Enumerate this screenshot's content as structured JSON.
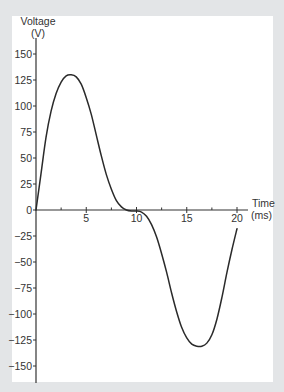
{
  "chart_data": {
    "type": "line",
    "title": "",
    "xlabel": "Time",
    "xunit": "(ms)",
    "ylabel": "Voltage",
    "yunit": "(V)",
    "xlim": [
      0,
      21
    ],
    "ylim": [
      -160,
      160
    ],
    "xticks": [
      0,
      5,
      10,
      15,
      20
    ],
    "xtick_labels": [
      "5",
      "10",
      "15",
      "20"
    ],
    "xminor_ticks": [
      2.5,
      7.5,
      12.5,
      17.5
    ],
    "yticks": [
      150,
      125,
      100,
      75,
      50,
      25,
      0,
      -25,
      -50,
      -75,
      -100,
      -125,
      -150
    ],
    "ytick_labels": [
      "150",
      "125",
      "100",
      "75",
      "50",
      "25",
      "0",
      "-25",
      "-50",
      "-75",
      "-100",
      "-125",
      "-150"
    ],
    "grid": false,
    "legend": "none",
    "series": [
      {
        "name": "Voltage",
        "color": "#2a2a2a",
        "x": [
          0,
          0.5,
          1,
          1.5,
          2,
          2.5,
          3,
          3.5,
          4,
          4.5,
          5,
          5.5,
          6,
          6.5,
          7,
          7.5,
          8,
          8.5,
          9,
          9.5,
          10,
          10.5,
          11,
          11.5,
          12,
          12.5,
          13,
          13.5,
          14,
          14.5,
          15,
          15.5,
          16,
          16.5,
          17,
          17.5,
          18,
          18.5,
          19,
          19.5,
          20
        ],
        "values": [
          0,
          35,
          70,
          95,
          112,
          123,
          129,
          130,
          128,
          121,
          108,
          92,
          72,
          52,
          34,
          20,
          9,
          3,
          0,
          -1,
          -1,
          -2,
          -6,
          -14,
          -26,
          -42,
          -60,
          -80,
          -98,
          -113,
          -123,
          -129,
          -131,
          -131,
          -128,
          -120,
          -105,
          -84,
          -60,
          -38,
          -18
        ]
      }
    ]
  },
  "colors": {
    "frame": "#e3e5e7",
    "panel": "#ffffff",
    "axis": "#333333",
    "line": "#2a2a2a"
  }
}
